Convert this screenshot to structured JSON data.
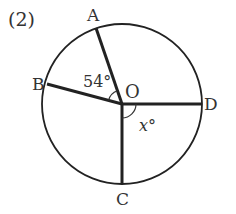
{
  "problem_number": "(2)",
  "center": {
    "label": "O",
    "x": 122,
    "y": 104
  },
  "circle": {
    "radius": 80,
    "stroke": "#222222"
  },
  "points": [
    {
      "label": "A",
      "x": 96,
      "y": 28,
      "label_x": 87,
      "label_y": 21
    },
    {
      "label": "B",
      "x": 47,
      "y": 84,
      "label_x": 32,
      "label_y": 90
    },
    {
      "label": "C",
      "x": 122,
      "y": 184,
      "label_x": 116,
      "label_y": 205
    },
    {
      "label": "D",
      "x": 202,
      "y": 104,
      "label_x": 204,
      "label_y": 110
    }
  ],
  "angles": [
    {
      "between": "AOB",
      "label": "54°"
    },
    {
      "between": "COD",
      "label": "x°"
    }
  ],
  "colors": {
    "line": "#222222",
    "text": "#333333",
    "background": "#ffffff"
  }
}
